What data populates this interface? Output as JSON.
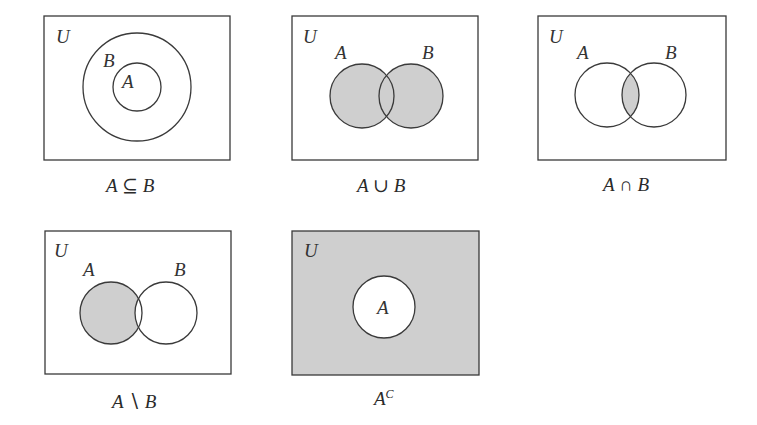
{
  "colors": {
    "stroke": "#3a3a3a",
    "shade": "#cfcfcf",
    "background": "#ffffff"
  },
  "diagrams": [
    {
      "id": "subset",
      "universe_label": "U",
      "set_a_label": "A",
      "set_b_label": "B",
      "caption_left": "A",
      "caption_op": "⊆",
      "caption_right": "B",
      "shaded": "none"
    },
    {
      "id": "union",
      "universe_label": "U",
      "set_a_label": "A",
      "set_b_label": "B",
      "caption_left": "A",
      "caption_op": "∪",
      "caption_right": "B",
      "shaded": "A or B"
    },
    {
      "id": "intersection",
      "universe_label": "U",
      "set_a_label": "A",
      "set_b_label": "B",
      "caption_left": "A",
      "caption_op": "∩",
      "caption_right": "B",
      "shaded": "A and B"
    },
    {
      "id": "difference",
      "universe_label": "U",
      "set_a_label": "A",
      "set_b_label": "B",
      "caption_left": "A",
      "caption_op": "∖",
      "caption_right": "B",
      "shaded": "A not B"
    },
    {
      "id": "complement",
      "universe_label": "U",
      "set_a_label": "A",
      "caption_left": "A",
      "caption_sup": "C",
      "shaded": "U not A"
    }
  ]
}
